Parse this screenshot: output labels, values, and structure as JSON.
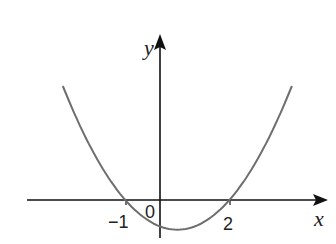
{
  "chart_data": {
    "type": "line",
    "title": "",
    "xlabel": "x",
    "ylabel": "y",
    "function": "y = a(x + 1)(x - 2), a > 0 (upward parabola)",
    "x_intercepts": [
      -1,
      2
    ],
    "origin_label": "0",
    "tick_labels": {
      "x": [
        "-1",
        "2"
      ]
    },
    "vertex": {
      "x": 0.5,
      "y": -0.9
    },
    "y_intercept": -0.8,
    "x_range": [
      -3.8,
      4.8
    ],
    "curve_x_range": [
      -2.8,
      3.8
    ],
    "grid": false,
    "legend": null,
    "colors": {
      "axes": "#111111",
      "curve": "#6e6e6e",
      "text": "#222222"
    }
  },
  "labels": {
    "x_axis": "x",
    "y_axis": "y",
    "origin": "0",
    "root_left": "−1",
    "root_right": "2"
  }
}
